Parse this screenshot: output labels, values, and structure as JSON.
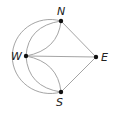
{
  "diagram": {
    "type": "graph",
    "nodes": [
      {
        "id": "N",
        "label": "N",
        "x": 61,
        "y": 21
      },
      {
        "id": "W",
        "label": "W",
        "x": 26,
        "y": 56
      },
      {
        "id": "E",
        "label": "E",
        "x": 96,
        "y": 57
      },
      {
        "id": "S",
        "label": "S",
        "x": 61,
        "y": 92
      }
    ],
    "edges": [
      {
        "from": "N",
        "to": "E",
        "shape": "straight"
      },
      {
        "from": "S",
        "to": "E",
        "shape": "straight"
      },
      {
        "from": "W",
        "to": "E",
        "shape": "straight"
      },
      {
        "from": "W",
        "to": "N",
        "shape": "curve-left"
      },
      {
        "from": "W",
        "to": "N",
        "shape": "curve-right"
      },
      {
        "from": "W",
        "to": "S",
        "shape": "curve-left"
      },
      {
        "from": "W",
        "to": "S",
        "shape": "curve-right"
      },
      {
        "from": "N",
        "to": "S",
        "shape": "outer-arc"
      }
    ],
    "colors": {
      "edge": "#9a9a9a",
      "node": "#111111",
      "label": "#222222"
    }
  }
}
